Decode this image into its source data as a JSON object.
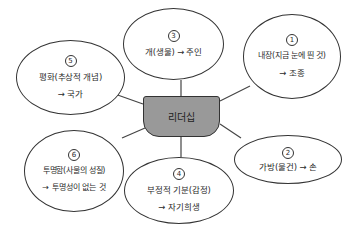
{
  "center": {
    "label": "리더십",
    "fill": "#999999"
  },
  "nodes": {
    "n1": {
      "number": "1",
      "line1": "내장(지금 눈에 띈 것)",
      "line2": "→ 조종"
    },
    "n2": {
      "number": "2",
      "line1": "가방(물건) → 손"
    },
    "n3": {
      "number": "3",
      "line1": "개(생물) → 주인"
    },
    "n4": {
      "number": "4",
      "line1": "부정적 기분(감정)",
      "line2": "→ 자기희생"
    },
    "n5": {
      "number": "5",
      "line1": "평화(추상적 개념)",
      "line2": "→ 국가"
    },
    "n6": {
      "number": "6",
      "line1": "투명함(사물의 성질)",
      "line2": "→ 투명성이 없는 것"
    }
  }
}
